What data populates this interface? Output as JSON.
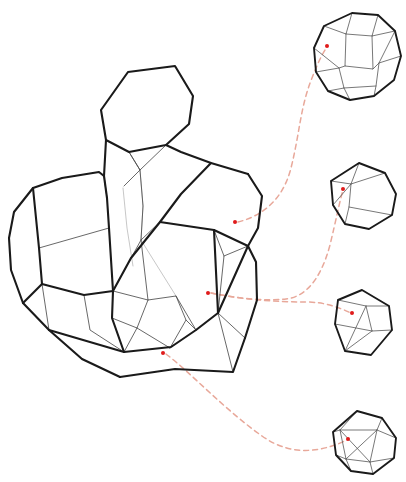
{
  "figure": {
    "type": "geometric-wireframe-diagram",
    "background_color": "#ffffff",
    "canvas": {
      "width": 406,
      "height": 482
    }
  },
  "style": {
    "major_edge_color": "#1a1a1a",
    "minor_edge_color": "#4d4d4d",
    "faint_edge_color": "#b9b9b9",
    "connector_color": "#e8a89a",
    "marker_color": "#e01b1b",
    "marker_radius": 2.0,
    "major_edge_width": 2.1,
    "minor_edge_width": 0.85,
    "connector_dash": "5 4"
  },
  "main_structure": {
    "name": "large-polyhedral-cluster",
    "label": "",
    "bounds": {
      "x": 8,
      "y": 62,
      "width": 265,
      "height": 322
    },
    "outline": "M 128,72 L 175,66 L 193,96 L 189,124 L 166,145 L 181,152 L 211,163 L 248,174 L 262,196 L 258,228 L 248,246 L 256,262 L 257,300 L 245,338 L 233,372 L 175,369 L 120,377 L 82,359 L 49,330 L 23,303 L 11,270 L 9,238 L 14,212 L 33,188 L 62,178 L 99,172 L 106,140 L 101,110 Z",
    "major_paths": [
      "M 128,72 L 175,66 L 193,96 L 189,124 L 166,145 L 129,152 L 106,140 L 101,110 Z",
      "M 106,140 L 104,176 L 107,198",
      "M 166,145 L 181,152 L 211,163 L 248,174",
      "M 248,174 L 262,196 L 258,228 L 248,246",
      "M 248,246 L 256,262 L 257,300 L 245,338",
      "M 245,338 L 233,372 L 175,369 L 120,377",
      "M 120,377 L 82,359 L 49,330",
      "M 49,330 L 23,303 L 11,270 L 9,238",
      "M 9,238 L 14,212 L 33,188 L 62,178 L 99,172 L 104,176",
      "M 33,188 L 39,248 L 42,284",
      "M 42,284 L 23,303",
      "M 42,284 L 84,295 L 113,291",
      "M 113,291 L 131,258 L 160,222 L 181,194 L 211,163",
      "M 113,291 L 112,318 L 124,352",
      "M 107,198 L 109,228 L 113,291",
      "M 160,222 L 214,230 L 248,246",
      "M 124,352 L 171,347 L 196,330 L 218,313",
      "M 218,313 L 248,246",
      "M 49,330 L 124,352",
      "M 214,230 L 218,313"
    ],
    "minor_paths": [
      "M 129,152 L 140,170 L 166,145",
      "M 129,152 L 140,170 L 124,186",
      "M 140,170 L 143,206 L 141,240",
      "M 104,176 L 107,198",
      "M 39,248 L 109,228",
      "M 42,284 L 49,330",
      "M 84,295 L 90,330 L 124,352",
      "M 113,291 L 148,300 L 176,296 L 186,320 L 170,348",
      "M 148,300 L 137,328 L 124,352",
      "M 137,328 L 170,348",
      "M 176,296 L 196,330",
      "M 186,320 L 196,330",
      "M 112,318 L 137,328",
      "M 171,347 L 170,348",
      "M 160,222 L 141,240 L 113,291",
      "M 141,240 L 148,300",
      "M 218,313 L 245,338",
      "M 214,230 L 224,256 L 218,313",
      "M 224,256 L 248,246",
      "M 233,372 L 218,313"
    ],
    "faint_paths": [
      "M 140,170 L 143,206 L 141,240",
      "M 123,188 L 127,228 L 133,266",
      "M 181,194 L 160,222",
      "M 141,240 L 176,296",
      "M 248,246 L 214,230"
    ],
    "markers": [
      {
        "id": "marker-main-1",
        "x": 235,
        "y": 222,
        "links_to": "small-polyhedron-1"
      },
      {
        "id": "marker-main-2",
        "x": 208,
        "y": 293,
        "links_to": "small-polyhedron-2"
      },
      {
        "id": "marker-main-3",
        "x": 163,
        "y": 353,
        "links_to": "small-polyhedron-4"
      }
    ]
  },
  "small_structures": [
    {
      "id": "small-polyhedron-1",
      "name": "truncated-octahedron",
      "position": {
        "cx": 357,
        "cy": 58
      },
      "bounds": {
        "x": 314,
        "y": 12,
        "width": 88,
        "height": 92
      },
      "marker": {
        "x": 327,
        "y": 46
      },
      "major_paths": [
        "M 352,13 L 378,15 L 395,31 L 401,56 L 394,80 L 374,96 L 350,100 L 328,91 L 316,72 L 314,48 L 324,26 Z"
      ],
      "minor_paths": [
        "M 352,13 L 346,34 L 324,26",
        "M 378,15 L 372,36 L 395,31",
        "M 346,34 L 372,36",
        "M 346,34 L 345,66 L 373,69 L 372,36",
        "M 316,72 L 339,68 L 345,66",
        "M 401,56 L 379,63 L 373,69",
        "M 339,68 L 344,88 L 328,91",
        "M 379,63 L 376,86 L 374,96",
        "M 344,88 L 350,100",
        "M 344,88 L 376,86",
        "M 314,48 L 339,68",
        "M 395,31 L 379,63"
      ]
    },
    {
      "id": "small-polyhedron-2",
      "name": "irregular-heptahedron",
      "position": {
        "cx": 364,
        "cy": 195
      },
      "bounds": {
        "x": 331,
        "y": 162,
        "width": 66,
        "height": 68
      },
      "marker": {
        "x": 343,
        "y": 189
      },
      "major_paths": [
        "M 359,163 L 385,173 L 396,194 L 392,215 L 369,229 L 345,224 L 333,205 L 331,181 Z"
      ],
      "minor_paths": [
        "M 359,163 L 351,184 L 333,205",
        "M 351,184 L 349,207 L 345,224",
        "M 351,184 L 385,173",
        "M 349,207 L 392,215",
        "M 331,181 L 351,184"
      ]
    },
    {
      "id": "small-polyhedron-3",
      "name": "irregular-pentahedron",
      "position": {
        "cx": 364,
        "cy": 320
      },
      "bounds": {
        "x": 334,
        "y": 289,
        "width": 62,
        "height": 68
      },
      "marker": {
        "x": 352,
        "y": 313
      },
      "major_paths": [
        "M 362,290 L 389,306 L 392,330 L 371,355 L 345,351 L 335,324 L 338,300 Z"
      ],
      "minor_paths": [
        "M 338,300 L 366,306 L 389,306",
        "M 366,306 L 372,331 L 392,330",
        "M 372,331 L 345,351",
        "M 335,324 L 372,331",
        "M 366,306 L 345,351"
      ]
    },
    {
      "id": "small-polyhedron-4",
      "name": "irregular-octahedron",
      "position": {
        "cx": 365,
        "cy": 443
      },
      "bounds": {
        "x": 333,
        "y": 410,
        "width": 68,
        "height": 68
      },
      "marker": {
        "x": 348,
        "y": 439
      },
      "major_paths": [
        "M 357,411 L 382,418 L 396,438 L 394,458 L 373,474 L 351,471 L 336,455 L 333,432 Z"
      ],
      "minor_paths": [
        "M 357,411 L 340,430 L 333,432",
        "M 340,430 L 346,459 L 351,471",
        "M 340,430 L 377,430 L 382,418",
        "M 377,430 L 370,462 L 373,474",
        "M 346,459 L 370,462",
        "M 336,455 L 346,459",
        "M 377,430 L 396,438",
        "M 340,430 L 370,462",
        "M 377,430 L 346,459",
        "M 394,458 L 370,462"
      ]
    }
  ],
  "connectors": [
    {
      "id": "connector-1",
      "name": "connector-main1-to-small1",
      "from": "marker-main-1",
      "to": "small-polyhedron-1",
      "path": "M 238,222 C 262,216 283,200 291,168 C 300,132 300,108 312,78 C 317,65 322,54 327,47"
    },
    {
      "id": "connector-2",
      "name": "connector-main2-to-small2",
      "from": "marker-main-2",
      "to": "small-polyhedron-2",
      "path": "M 211,293 C 240,299 266,301 286,299 C 304,297 320,282 330,245 C 336,220 340,200 343,190"
    },
    {
      "id": "connector-3",
      "name": "connector-main2-to-small3",
      "from": "marker-main-2",
      "to": "small-polyhedron-3",
      "path": "M 211,293 C 245,300 278,302 306,302 C 326,302 340,308 351,313"
    },
    {
      "id": "connector-4",
      "name": "connector-main3-to-small4",
      "from": "marker-main-3",
      "to": "small-polyhedron-4",
      "path": "M 166,354 C 190,372 225,410 262,436 C 294,459 326,450 347,440"
    }
  ]
}
